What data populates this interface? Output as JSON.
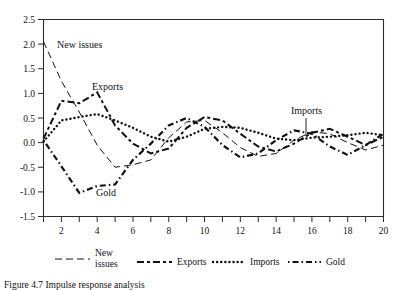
{
  "chart_data": {
    "type": "line",
    "title": "",
    "xlabel": "",
    "ylabel": "",
    "xlim": [
      1,
      20
    ],
    "ylim": [
      -1.5,
      2.5
    ],
    "grid": false,
    "legend_position": "below-axis",
    "y_ticks": [
      "2.5",
      "2.0",
      "1.5",
      "1.0",
      "0.5",
      "0.0",
      "-0.5",
      "-1.0",
      "-1.5"
    ],
    "y_tick_values": [
      2.5,
      2.0,
      1.5,
      1.0,
      0.5,
      0.0,
      -0.5,
      -1.0,
      -1.5
    ],
    "x_ticks_all": [
      1,
      2,
      3,
      4,
      5,
      6,
      7,
      8,
      9,
      10,
      11,
      12,
      13,
      14,
      15,
      16,
      17,
      18,
      19,
      20
    ],
    "x_tick_labels": [
      "2",
      "4",
      "6",
      "8",
      "10",
      "12",
      "14",
      "16",
      "18",
      "20"
    ],
    "x_tick_label_values": [
      2,
      4,
      6,
      8,
      10,
      12,
      14,
      16,
      18,
      20
    ],
    "x": [
      1,
      2,
      3,
      4,
      5,
      6,
      7,
      8,
      9,
      10,
      11,
      12,
      13,
      14,
      15,
      16,
      17,
      18,
      19,
      20
    ],
    "series": [
      {
        "name": "New issues",
        "dash": "long-dash",
        "values": [
          2.05,
          1.25,
          0.62,
          -0.05,
          -0.5,
          -0.45,
          -0.35,
          0.1,
          0.42,
          0.45,
          0.2,
          -0.1,
          -0.28,
          -0.22,
          0.05,
          0.22,
          0.18,
          0.0,
          -0.15,
          -0.05
        ]
      },
      {
        "name": "Exports",
        "dash": "dash-dot",
        "values": [
          0.08,
          0.85,
          0.8,
          1.02,
          0.35,
          -0.02,
          -0.22,
          -0.12,
          0.3,
          0.52,
          0.45,
          0.18,
          -0.08,
          -0.18,
          -0.02,
          0.2,
          0.28,
          0.12,
          -0.05,
          0.12
        ]
      },
      {
        "name": "Imports",
        "dash": "dotted",
        "values": [
          0.02,
          0.45,
          0.52,
          0.58,
          0.45,
          0.3,
          0.12,
          0.02,
          0.12,
          0.28,
          0.32,
          0.3,
          0.2,
          0.08,
          0.05,
          0.1,
          0.12,
          0.15,
          0.2,
          0.15
        ]
      },
      {
        "name": "Gold",
        "dash": "dot-dash",
        "values": [
          0.05,
          -0.48,
          -1.02,
          -0.88,
          -0.85,
          -0.35,
          -0.02,
          0.35,
          0.5,
          0.32,
          -0.05,
          -0.3,
          -0.22,
          0.05,
          0.25,
          0.18,
          -0.08,
          -0.25,
          -0.05,
          0.18
        ]
      }
    ],
    "annotations": [
      {
        "label": "New issues",
        "x": 1.9,
        "y": 1.8
      },
      {
        "label": "Exports",
        "x": 4.0,
        "y": 0.98
      },
      {
        "label": "Gold",
        "x": 4.2,
        "y": -1.12
      },
      {
        "label": "Imports",
        "x": 16.0,
        "y": 0.52,
        "leader": true
      }
    ]
  },
  "legend": {
    "items": [
      {
        "label_line1": "New",
        "label_line2": "issues",
        "dash": "long-dash"
      },
      {
        "label_line1": "Exports",
        "label_line2": "",
        "dash": "dash-dot"
      },
      {
        "label_line1": "Imports",
        "label_line2": "",
        "dash": "dotted"
      },
      {
        "label_line1": "Gold",
        "label_line2": "",
        "dash": "dot-dash"
      }
    ]
  },
  "caption": {
    "text": "Figure 4.7  Impulse response analysis"
  }
}
